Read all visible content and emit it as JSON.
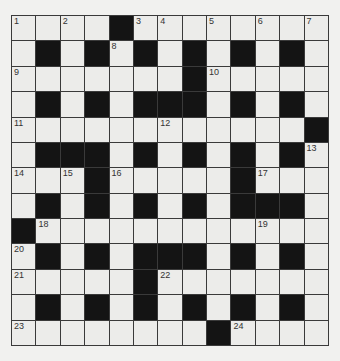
{
  "puzzle": {
    "type": "crossword",
    "rows": 13,
    "cols": 13,
    "colors": {
      "background": "#f1f1ef",
      "white_cell": "#ececea",
      "black_cell": "#141414",
      "grid_line": "#3a3a3a"
    },
    "grid": [
      "....#........",
      ".#.#.#.#.#.#.",
      ".......#.....",
      ".#.#.###.#.#.",
      "............#",
      ".###.#.#.#.#.",
      "...#.....#...",
      ".#.#.#.#.###.",
      "#............",
      ".#.#.###.#.#.",
      ".....#.......",
      ".#.#.#.#.#.#.",
      "........#...."
    ],
    "numbers": [
      {
        "n": "1",
        "r": 0,
        "c": 0
      },
      {
        "n": "2",
        "r": 0,
        "c": 2
      },
      {
        "n": "3",
        "r": 0,
        "c": 5
      },
      {
        "n": "4",
        "r": 0,
        "c": 6
      },
      {
        "n": "5",
        "r": 0,
        "c": 8
      },
      {
        "n": "6",
        "r": 0,
        "c": 10
      },
      {
        "n": "7",
        "r": 0,
        "c": 12
      },
      {
        "n": "8",
        "r": 1,
        "c": 4
      },
      {
        "n": "9",
        "r": 2,
        "c": 0
      },
      {
        "n": "10",
        "r": 2,
        "c": 8
      },
      {
        "n": "11",
        "r": 4,
        "c": 0
      },
      {
        "n": "12",
        "r": 4,
        "c": 6
      },
      {
        "n": "13",
        "r": 5,
        "c": 12
      },
      {
        "n": "14",
        "r": 6,
        "c": 0
      },
      {
        "n": "15",
        "r": 6,
        "c": 2
      },
      {
        "n": "16",
        "r": 6,
        "c": 4
      },
      {
        "n": "17",
        "r": 6,
        "c": 10
      },
      {
        "n": "18",
        "r": 8,
        "c": 1
      },
      {
        "n": "19",
        "r": 8,
        "c": 10
      },
      {
        "n": "20",
        "r": 9,
        "c": 0
      },
      {
        "n": "21",
        "r": 10,
        "c": 0
      },
      {
        "n": "22",
        "r": 10,
        "c": 6
      },
      {
        "n": "23",
        "r": 12,
        "c": 0
      },
      {
        "n": "24",
        "r": 12,
        "c": 9
      }
    ]
  }
}
